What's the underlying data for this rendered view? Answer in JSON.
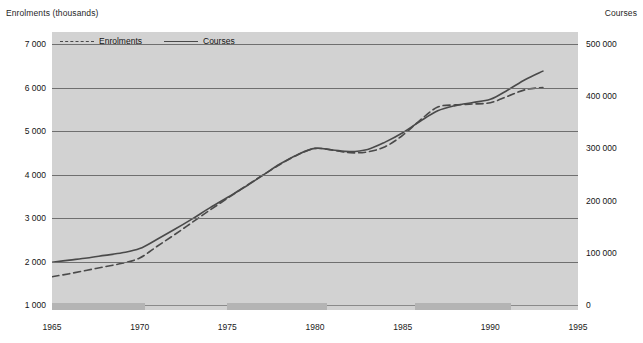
{
  "axes": {
    "left_title": "Enrolments (thousands)",
    "right_title": "Courses",
    "left_ticks": [
      "7 000",
      "6 000",
      "5 000",
      "4 000",
      "3 000",
      "2 000",
      "1 000"
    ],
    "right_ticks": [
      "500 000",
      "400 000",
      "300 000",
      "200 000",
      "100 000",
      "0"
    ],
    "x_ticks": [
      "1965",
      "1970",
      "1975",
      "1980",
      "1985",
      "1990",
      "1995"
    ]
  },
  "legend": {
    "items": [
      {
        "label": "Enrolments",
        "style": "dashed",
        "color": "#4a4a4a"
      },
      {
        "label": "Courses",
        "style": "solid",
        "color": "#4a4a4a"
      }
    ]
  },
  "colors": {
    "plot_background": "#d2d2d2",
    "gridline": "#6f6f6f",
    "band": "#b4b4b4",
    "series_line": "#4a4a4a",
    "page_background": "#ffffff",
    "text": "#141414"
  },
  "chart_data": {
    "type": "line",
    "title": "",
    "subtitle": "",
    "xlabel": "",
    "ylabel": "Enrolments (thousands)",
    "y2label": "Courses",
    "grid": true,
    "legend_position": "top-left inside plot",
    "xlim": [
      1965,
      1995
    ],
    "ylim": [
      1000,
      7000
    ],
    "y2lim": [
      0,
      500000
    ],
    "x": [
      1965,
      1966,
      1967,
      1968,
      1969,
      1970,
      1971,
      1972,
      1973,
      1974,
      1975,
      1976,
      1977,
      1978,
      1979,
      1980,
      1981,
      1982,
      1983,
      1984,
      1985,
      1986,
      1987,
      1988,
      1989,
      1990,
      1991,
      1992,
      1993
    ],
    "series": [
      {
        "name": "Enrolments",
        "axis": "left",
        "unit": "thousands",
        "style": "dashed",
        "values": [
          1650,
          1720,
          1800,
          1880,
          1960,
          2080,
          2350,
          2620,
          2900,
          3180,
          3450,
          3720,
          3980,
          4230,
          4450,
          4600,
          4560,
          4500,
          4520,
          4640,
          4900,
          5250,
          5550,
          5600,
          5620,
          5650,
          5800,
          5950,
          6000
        ]
      },
      {
        "name": "Courses",
        "axis": "right",
        "unit": "courses",
        "style": "solid",
        "values": [
          82000,
          86000,
          90000,
          95000,
          100000,
          108000,
          126000,
          145000,
          165000,
          186000,
          206000,
          226000,
          248000,
          270000,
          288000,
          300000,
          297000,
          294000,
          298000,
          312000,
          330000,
          352000,
          372000,
          382000,
          388000,
          394000,
          412000,
          432000,
          448000
        ]
      }
    ],
    "annotations": {
      "shaded_bands": [
        {
          "label": "band-1",
          "x_start": 1965.0,
          "x_end": 1970.3
        },
        {
          "label": "band-2",
          "x_start": 1975.0,
          "x_end": 1980.7
        },
        {
          "label": "band-3",
          "x_start": 1985.7,
          "x_end": 1991.2
        }
      ]
    }
  }
}
